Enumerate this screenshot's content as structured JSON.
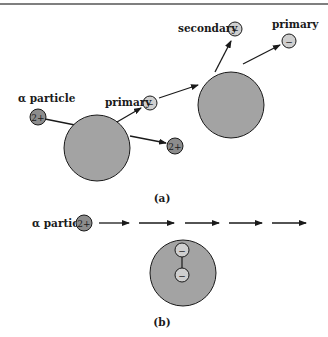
{
  "figure": {
    "panel_a": {
      "caption": "(a)",
      "alpha_label": "α particle",
      "alpha_charge": "2+",
      "scattered_alpha_charge": "2+",
      "primary_left_label": "primary",
      "secondary_label": "secondary",
      "primary_right_label": "primary",
      "electron_charge": "−"
    },
    "panel_b": {
      "caption": "(b)",
      "alpha_label": "α particle",
      "alpha_charge": "2+",
      "electron_charge": "−"
    },
    "colors": {
      "nucleus_fill": "#a3a3a3",
      "alpha_fill": "#8c8c8c",
      "electron_fill": "#cfcfcf",
      "stroke": "#1a1a1a"
    }
  }
}
